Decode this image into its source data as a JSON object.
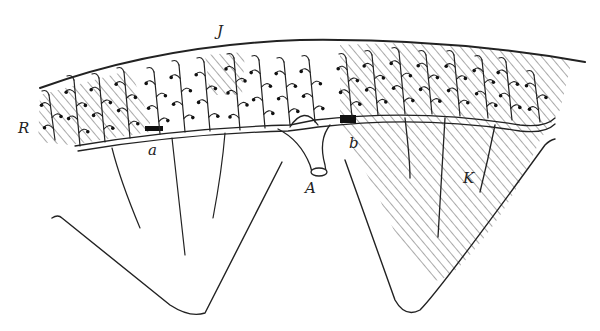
{
  "figure": {
    "type": "anatomical line drawing",
    "colors": {
      "ink": "#222222",
      "hatch": "#555555",
      "background": "#ffffff"
    },
    "labels": {
      "J": "J",
      "R": "R",
      "a": "a",
      "A": "A",
      "b": "b",
      "K": "K"
    },
    "regions": [
      {
        "name": "left-lobe",
        "hatched_area": "upper-left branches"
      },
      {
        "name": "right-lobe",
        "hatched_area": "whole lobe"
      }
    ]
  }
}
